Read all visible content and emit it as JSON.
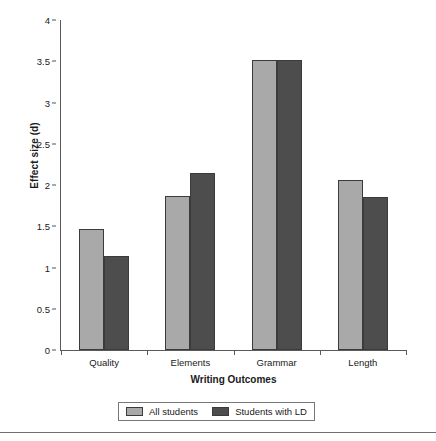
{
  "chart_data": {
    "type": "bar",
    "title": "",
    "xlabel": "Writing Outcomes",
    "ylabel": "Effect size (d)",
    "categories": [
      "Quality",
      "Elements",
      "Grammar",
      "Length"
    ],
    "series": [
      {
        "name": "All students",
        "color": "#a9a9a9",
        "values": [
          1.47,
          1.87,
          3.52,
          2.06
        ]
      },
      {
        "name": "Students with LD",
        "color": "#4d4d4d",
        "values": [
          1.14,
          2.15,
          3.52,
          1.86
        ]
      }
    ],
    "ylim": [
      0,
      4
    ],
    "yticks": [
      "0",
      "0.5",
      "1",
      "1.5",
      "2",
      "2.5",
      "3",
      "3.5",
      "4"
    ],
    "ytick_values": [
      0,
      0.5,
      1,
      1.5,
      2,
      2.5,
      3,
      3.5,
      4
    ],
    "grid": false,
    "legend_position": "bottom"
  },
  "legend": {
    "items": [
      {
        "label": "All students"
      },
      {
        "label": "Students with LD"
      }
    ]
  }
}
